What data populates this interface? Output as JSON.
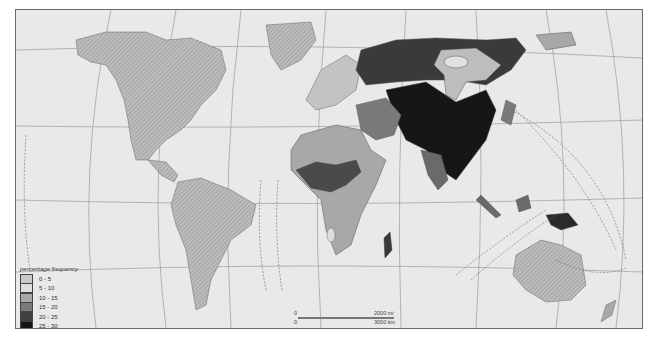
{
  "map": {
    "title": "",
    "legend": {
      "title": "percentage frequency",
      "items": [
        {
          "label": "0 - 5",
          "color": "#c9c9c9"
        },
        {
          "label": "5 - 10",
          "color": "#dedede"
        },
        {
          "label": "10 - 15",
          "color": "#a8a8a8"
        },
        {
          "label": "15 - 20",
          "color": "#7a7a7a"
        },
        {
          "label": "20 - 25",
          "color": "#3f3f3f"
        },
        {
          "label": "25 - 30",
          "color": "#141414"
        }
      ]
    },
    "scale": {
      "zero_mi": "0",
      "mi_label": "2000 mi",
      "zero_km": "0",
      "km_label": "3000 km"
    },
    "isoline_labels": [
      "5",
      "10",
      "15",
      "15",
      "10",
      "5",
      "15",
      "10",
      "15",
      "5"
    ],
    "colors": {
      "ocean": "#e9e9e9",
      "hatched_land": "#b9b9b9",
      "graticule": "#8a8a8a"
    }
  }
}
